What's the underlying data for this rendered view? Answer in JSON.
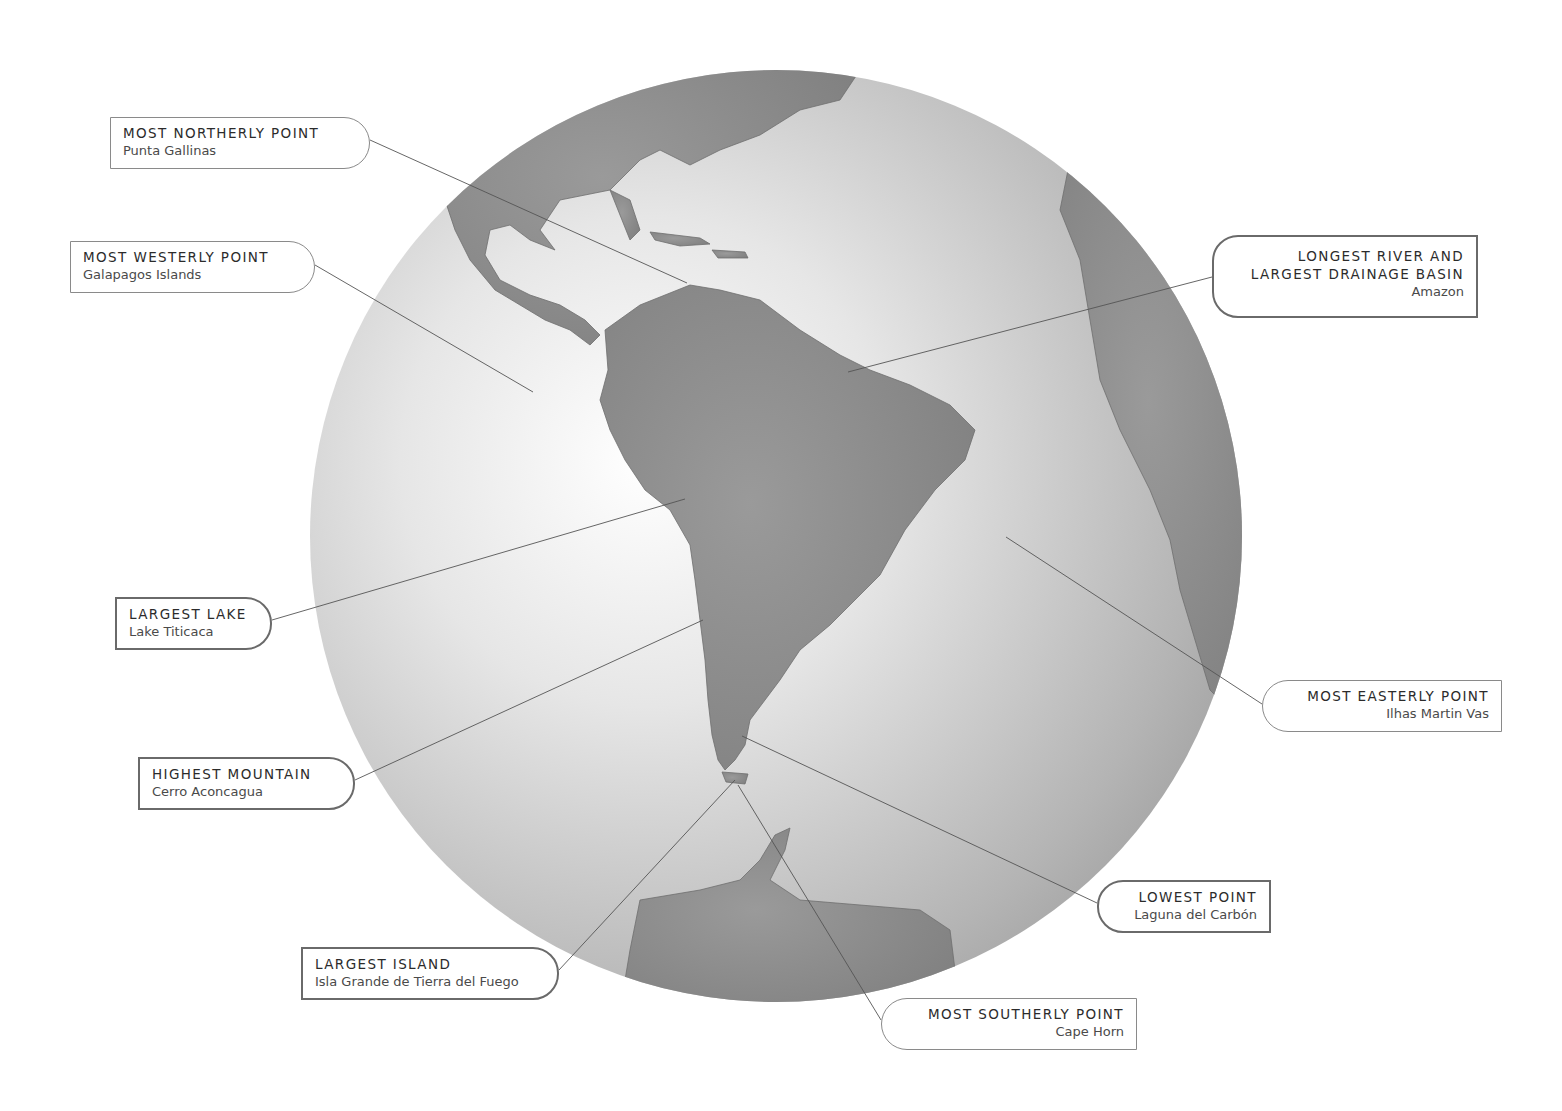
{
  "map": {
    "subject": "South America on a globe",
    "globe": {
      "cx": 776,
      "cy": 536,
      "r": 466,
      "ocean_light": "#ffffff",
      "ocean_dark": "#9c9c9c",
      "land": "#8e8e8e"
    },
    "callouts": [
      {
        "id": "northerly",
        "title": "MOST NORTHERLY POINT",
        "place": "Punta Gallinas",
        "box": [
          110,
          117,
          260,
          52
        ],
        "cap": "left",
        "weight": "thin",
        "anchor": [
          370,
          140
        ],
        "target": [
          687,
          283
        ]
      },
      {
        "id": "westerly",
        "title": "MOST WESTERLY POINT",
        "place": "Galapagos Islands",
        "box": [
          70,
          241,
          245,
          52
        ],
        "cap": "left",
        "weight": "thin",
        "anchor": [
          315,
          265
        ],
        "target": [
          533,
          392
        ]
      },
      {
        "id": "river",
        "title": "LONGEST RIVER AND LARGEST DRAINAGE BASIN",
        "title_lines": [
          "LONGEST RIVER AND",
          "LARGEST DRAINAGE BASIN"
        ],
        "place": "Amazon",
        "box": [
          1212,
          235,
          266,
          83
        ],
        "cap": "right",
        "weight": "thick",
        "anchor": [
          1212,
          277
        ],
        "target": [
          848,
          372
        ]
      },
      {
        "id": "lake",
        "title": "LARGEST LAKE",
        "place": "Lake Titicaca",
        "box": [
          115,
          597,
          157,
          53
        ],
        "cap": "left",
        "weight": "thick",
        "anchor": [
          272,
          620
        ],
        "target": [
          685,
          499
        ]
      },
      {
        "id": "mountain",
        "title": "HIGHEST MOUNTAIN",
        "place": "Cerro Aconcagua",
        "box": [
          138,
          757,
          217,
          53
        ],
        "cap": "left",
        "weight": "thick",
        "anchor": [
          355,
          780
        ],
        "target": [
          703,
          620
        ]
      },
      {
        "id": "easterly",
        "title": "MOST EASTERLY POINT",
        "place": "Ilhas Martin Vas",
        "box": [
          1262,
          680,
          240,
          52
        ],
        "cap": "right",
        "weight": "thin",
        "anchor": [
          1262,
          704
        ],
        "target": [
          1006,
          537
        ]
      },
      {
        "id": "lowest",
        "title": "LOWEST POINT",
        "place": "Laguna del Carbón",
        "box": [
          1097,
          880,
          174,
          53
        ],
        "cap": "right",
        "weight": "thick",
        "anchor": [
          1097,
          903
        ],
        "target": [
          742,
          736
        ]
      },
      {
        "id": "island",
        "title": "LARGEST ISLAND",
        "place": "Isla Grande de Tierra del Fuego",
        "box": [
          301,
          947,
          258,
          53
        ],
        "cap": "left",
        "weight": "thick",
        "anchor": [
          559,
          970
        ],
        "target": [
          735,
          780
        ]
      },
      {
        "id": "southerly",
        "title": "MOST SOUTHERLY POINT",
        "place": "Cape Horn",
        "box": [
          881,
          998,
          256,
          52
        ],
        "cap": "right",
        "weight": "thin",
        "anchor": [
          881,
          1020
        ],
        "target": [
          738,
          785
        ]
      }
    ]
  }
}
